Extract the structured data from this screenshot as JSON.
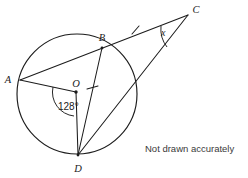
{
  "figure": {
    "caption": "Not drawn accurately",
    "stroke_color": "#1c1c1c",
    "background_color": "#ffffff",
    "points": {
      "A": {
        "label": "A",
        "x": 20,
        "y": 80
      },
      "B": {
        "label": "B",
        "x": 102,
        "y": 48
      },
      "C": {
        "label": "C",
        "x": 188,
        "y": 15
      },
      "D": {
        "label": "D",
        "x": 78,
        "y": 155
      },
      "O": {
        "label": "O",
        "x": 76,
        "y": 92
      }
    },
    "circle": {
      "cx": 77,
      "cy": 94,
      "r": 60
    },
    "angles": [
      {
        "name": "angle-AOD",
        "label": "128°",
        "vertex": "O",
        "value": 128,
        "unit": "degrees"
      },
      {
        "name": "angle-BCD",
        "label": "x",
        "vertex": "C",
        "value": null,
        "unit": "unknown"
      }
    ],
    "segments": [
      {
        "name": "segment-AC",
        "from": "A",
        "to": "C",
        "note": "A, B, C collinear"
      },
      {
        "name": "segment-BD",
        "from": "B",
        "to": "D"
      },
      {
        "name": "segment-DC",
        "from": "D",
        "to": "C"
      },
      {
        "name": "segment-AO",
        "from": "A",
        "to": "O"
      },
      {
        "name": "segment-OD",
        "from": "O",
        "to": "D"
      }
    ],
    "tick_marks": [
      {
        "name": "tick-on-BC",
        "segment": "BC",
        "count": 1
      },
      {
        "name": "tick-on-BD",
        "segment": "BD",
        "count": 1
      }
    ]
  }
}
